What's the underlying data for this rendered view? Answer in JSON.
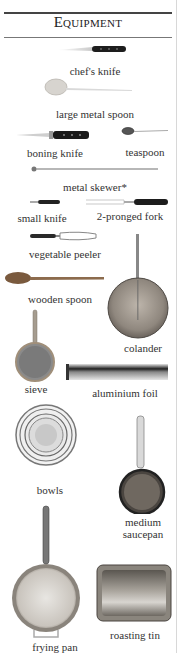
{
  "header": {
    "title": "Equipment"
  },
  "items": [
    {
      "id": "chefs-knife",
      "label": "chef's knife"
    },
    {
      "id": "large-metal-spoon",
      "label": "large metal spoon"
    },
    {
      "id": "boning-knife",
      "label": "boning knife"
    },
    {
      "id": "teaspoon",
      "label": "teaspoon"
    },
    {
      "id": "metal-skewer",
      "label": "metal skewer*"
    },
    {
      "id": "small-knife",
      "label": "small knife"
    },
    {
      "id": "two-pronged-fork",
      "label": "2-pronged fork"
    },
    {
      "id": "vegetable-peeler",
      "label": "vegetable peeler"
    },
    {
      "id": "wooden-spoon",
      "label": "wooden spoon"
    },
    {
      "id": "colander",
      "label": "colander"
    },
    {
      "id": "sieve",
      "label": "sieve"
    },
    {
      "id": "aluminium-foil",
      "label": "aluminium foil"
    },
    {
      "id": "bowls",
      "label": "bowls"
    },
    {
      "id": "medium-saucepan",
      "label_line1": "medium",
      "label_line2": "saucepan"
    },
    {
      "id": "frying-pan",
      "label": "frying pan"
    },
    {
      "id": "roasting-tin",
      "label": "roasting tin"
    }
  ]
}
